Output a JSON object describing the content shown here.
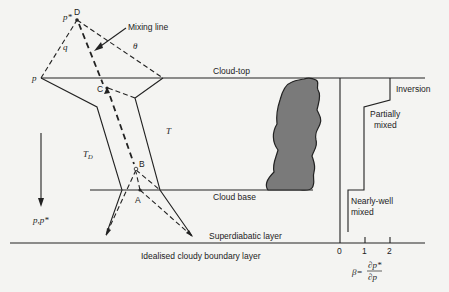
{
  "diagram": {
    "caption": "Idealised cloudy boundary layer",
    "points": {
      "D": "D",
      "C": "C",
      "B": "B",
      "A": "A"
    },
    "symbols": {
      "p_star": "p*",
      "p": "p",
      "q": "q",
      "theta": "θ",
      "T": "T",
      "T_D": "T",
      "T_D_sub": "D",
      "p_axis": "p,p*"
    },
    "annotations": {
      "mixing_line": "Mixing line",
      "cloud_top": "Cloud-top",
      "cloud_base": "Cloud base",
      "superdiabatic": "Superdiabatic layer",
      "inversion": "Inversion",
      "partially_mixed_1": "Partially",
      "partially_mixed_2": "mixed",
      "nearly_well_1": "Nearly-well",
      "nearly_well_2": "mixed"
    },
    "beta_axis": {
      "ticks": [
        "0",
        "1",
        "2"
      ],
      "label_beta": "β=",
      "label_num": "∂p*",
      "label_den": "∂p"
    },
    "colors": {
      "ink": "#222222",
      "cloud_fill": "#7a7a7a",
      "background": "#f4f4f2"
    }
  }
}
